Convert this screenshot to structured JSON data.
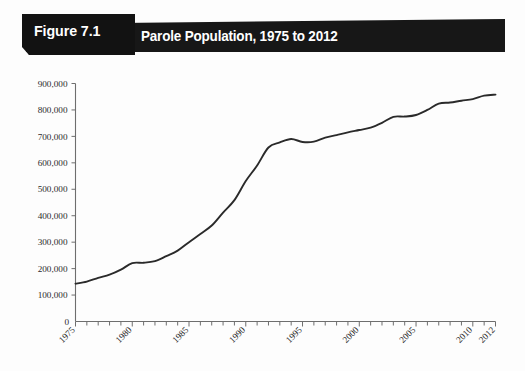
{
  "figure": {
    "number_label": "Figure 7.1",
    "title": "Parole Population, 1975 to 2012",
    "banner_color": "#171717",
    "banner_text_color": "#ffffff"
  },
  "chart_data": {
    "type": "line",
    "title": "Parole Population, 1975 to 2012",
    "xlabel": "",
    "ylabel": "",
    "grid": false,
    "legend": null,
    "line_color": "#2a2a2a",
    "xlim": [
      1975,
      2012
    ],
    "ylim": [
      0,
      900000
    ],
    "ytick_labels": [
      "900,000",
      "800,000",
      "700,000",
      "600,000",
      "500,000",
      "400,000",
      "300,000",
      "200,000",
      "100,000"
    ],
    "ytick_values": [
      900000,
      800000,
      700000,
      600000,
      500000,
      400000,
      300000,
      200000,
      100000
    ],
    "origin_label": "0",
    "xtick_labels": [
      "1975",
      "1980",
      "1985",
      "1990",
      "1995",
      "2000",
      "2005",
      "2010",
      "2012"
    ],
    "xtick_values": [
      1975,
      1980,
      1985,
      1990,
      1995,
      2000,
      2005,
      2010,
      2012
    ],
    "x": [
      1975,
      1976,
      1977,
      1978,
      1979,
      1980,
      1981,
      1982,
      1983,
      1984,
      1985,
      1986,
      1987,
      1988,
      1989,
      1990,
      1991,
      1992,
      1993,
      1994,
      1995,
      1996,
      1997,
      1998,
      1999,
      2000,
      2001,
      2002,
      2003,
      2004,
      2005,
      2006,
      2007,
      2008,
      2009,
      2010,
      2011,
      2012
    ],
    "values": [
      143000,
      151000,
      165000,
      177000,
      196000,
      221000,
      222000,
      228000,
      247000,
      268000,
      300000,
      331000,
      363000,
      412000,
      459000,
      531000,
      590000,
      658000,
      677000,
      690000,
      679000,
      680000,
      695000,
      705000,
      715000,
      724000,
      733000,
      751000,
      774000,
      775000,
      781000,
      800000,
      824000,
      828000,
      835000,
      841000,
      854000,
      858000
    ],
    "series_name": "Parole Population",
    "units": "persons",
    "start_value": 143000,
    "end_value": 858000
  }
}
